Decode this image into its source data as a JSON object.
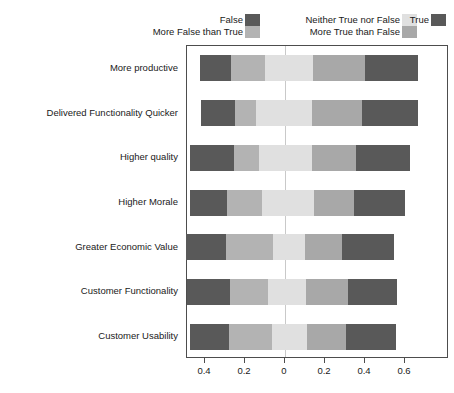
{
  "chart_data": {
    "type": "bar",
    "subtype": "diverging-stacked-bar",
    "title": "",
    "xlabel": "",
    "ylabel": "",
    "orientation": "horizontal",
    "grid": false,
    "legend_position": "top",
    "xlim": [
      -0.52,
      0.7
    ],
    "zero_reference": 0,
    "xticks": [
      -0.4,
      -0.2,
      0,
      0.2,
      0.4,
      0.6
    ],
    "xticklabels": [
      "0.4",
      "0.2",
      "0",
      "0.2",
      "0.4",
      "0.6"
    ],
    "categories": [
      "More productive",
      "Delivered Functionality Quicker",
      "Higher quality",
      "Higher Morale",
      "Greater Economic Value",
      "Customer Functionality",
      "Customer Usability"
    ],
    "series": [
      {
        "name": "False",
        "color": "#595959",
        "values": [
          0.155,
          0.17,
          0.22,
          0.185,
          0.2,
          0.215,
          0.195
        ]
      },
      {
        "name": "More False than True",
        "color": "#b3b3b3",
        "values": [
          0.17,
          0.105,
          0.125,
          0.175,
          0.235,
          0.19,
          0.215
        ]
      },
      {
        "name": "Neither True nor False",
        "color": "#e0e0e0",
        "values": [
          0.24,
          0.28,
          0.265,
          0.26,
          0.16,
          0.19,
          0.175
        ]
      },
      {
        "name": "More True than False",
        "color": "#a8a8a8",
        "values": [
          0.26,
          0.25,
          0.22,
          0.2,
          0.185,
          0.21,
          0.195
        ]
      },
      {
        "name": "True",
        "color": "#595959",
        "values": [
          0.265,
          0.28,
          0.27,
          0.255,
          0.26,
          0.245,
          0.25
        ]
      }
    ],
    "bar_starts": [
      -0.425,
      -0.42,
      -0.475,
      -0.475,
      -0.495,
      -0.49,
      -0.475
    ],
    "bar_ends": [
      0.665,
      0.665,
      0.625,
      0.6,
      0.545,
      0.56,
      0.555
    ]
  },
  "legend": {
    "entries": [
      {
        "label": "False",
        "color": "#595959",
        "col": 0,
        "row": 0
      },
      {
        "label": "More False than True",
        "color": "#b3b3b3",
        "col": 0,
        "row": 1
      },
      {
        "label": "Neither True nor False",
        "color": "#e0e0e0",
        "col": 1,
        "row": 0
      },
      {
        "label": "More True than False",
        "color": "#a8a8a8",
        "col": 1,
        "row": 1
      },
      {
        "label": "True",
        "color": "#595959",
        "col": 2,
        "row": 0
      }
    ]
  },
  "axis": {
    "frame_color": "#4d4d4d",
    "zero_line_color": "#c9c9c9",
    "tick_color": "#4d4d4d"
  }
}
